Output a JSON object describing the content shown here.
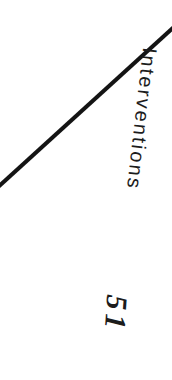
{
  "colors": {
    "background": "#ffffff",
    "ink": "#1c1c1c",
    "line": "#141414"
  },
  "labels": {
    "interventions": "Interventions",
    "page_number": "51"
  },
  "figure": {
    "diagonal_line": {
      "x1": -2,
      "y1": 187,
      "x2": 174,
      "y2": 27,
      "stroke_width": 4
    }
  }
}
